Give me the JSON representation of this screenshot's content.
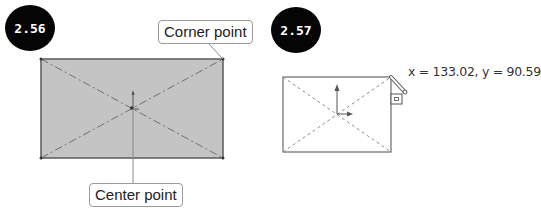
{
  "figures": [
    {
      "id_label": "2.56",
      "callouts": {
        "corner": "Corner point",
        "center": "Center point"
      },
      "rect_fill": "#c4c4c4",
      "rect_stroke": "#5a5a5a"
    },
    {
      "id_label": "2.57",
      "coordinates": "x = 133.02, y = 90.59",
      "rect_fill": "#ffffff",
      "rect_stroke": "#6a6a6a"
    }
  ],
  "colors": {
    "badge_bg": "#050505",
    "badge_text": "#ffffff",
    "diagonal": "#7a7a7a",
    "axis": "#666666"
  }
}
